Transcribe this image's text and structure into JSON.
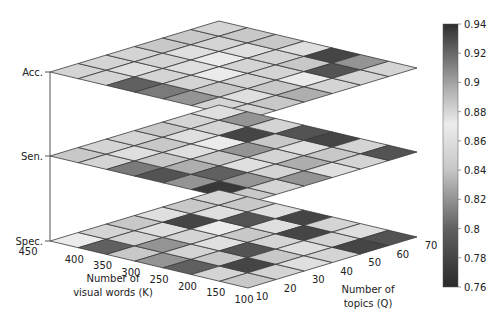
{
  "chart_data": {
    "type": "heatmap",
    "title": "",
    "layers": [
      "Acc.",
      "Sen.",
      "Spec."
    ],
    "xlabel": "Number of visual words (K)",
    "xlabel_lines": [
      "Number of",
      "visual words (K)"
    ],
    "ylabel": "Number of topics (Q)",
    "ylabel_lines": [
      "Number of",
      "topics (Q)"
    ],
    "x_ticks": [
      "450",
      "400",
      "350",
      "300",
      "250",
      "200",
      "150",
      "100"
    ],
    "y_ticks": [
      "10",
      "20",
      "30",
      "40",
      "50",
      "60",
      "70"
    ],
    "colorbar": {
      "ticks": [
        "0.94",
        "0.92",
        "0.9",
        "0.88",
        "0.86",
        "0.84",
        "0.82",
        "0.8",
        "0.78",
        "0.76"
      ],
      "range": [
        0.76,
        0.94
      ]
    },
    "grid_rows_K": 7,
    "grid_cols_Q": 6,
    "series": [
      {
        "name": "Acc.",
        "values": [
          [
            0.85,
            0.85,
            0.85,
            0.84,
            0.84,
            0.85
          ],
          [
            0.85,
            0.86,
            0.85,
            0.86,
            0.85,
            0.84
          ],
          [
            0.8,
            0.85,
            0.86,
            0.87,
            0.86,
            0.84
          ],
          [
            0.81,
            0.85,
            0.87,
            0.85,
            0.85,
            0.86
          ],
          [
            0.82,
            0.84,
            0.85,
            0.85,
            0.84,
            0.78
          ],
          [
            0.85,
            0.86,
            0.84,
            0.87,
            0.79,
            0.82
          ],
          [
            0.85,
            0.84,
            0.83,
            0.85,
            0.85,
            0.85
          ]
        ]
      },
      {
        "name": "Sen.",
        "values": [
          [
            0.84,
            0.85,
            0.85,
            0.84,
            0.85,
            0.86
          ],
          [
            0.85,
            0.86,
            0.84,
            0.86,
            0.85,
            0.82
          ],
          [
            0.81,
            0.84,
            0.86,
            0.87,
            0.78,
            0.85
          ],
          [
            0.79,
            0.83,
            0.84,
            0.82,
            0.84,
            0.79
          ],
          [
            0.82,
            0.8,
            0.86,
            0.85,
            0.86,
            0.78
          ],
          [
            0.77,
            0.82,
            0.85,
            0.83,
            0.84,
            0.85
          ],
          [
            0.84,
            0.85,
            0.82,
            0.86,
            0.85,
            0.79
          ]
        ]
      },
      {
        "name": "Spec.",
        "values": [
          [
            0.87,
            0.85,
            0.84,
            0.86,
            0.84,
            0.85
          ],
          [
            0.8,
            0.85,
            0.86,
            0.78,
            0.86,
            0.84
          ],
          [
            0.84,
            0.82,
            0.85,
            0.87,
            0.79,
            0.86
          ],
          [
            0.82,
            0.85,
            0.86,
            0.84,
            0.86,
            0.78
          ],
          [
            0.8,
            0.84,
            0.79,
            0.85,
            0.78,
            0.85
          ],
          [
            0.85,
            0.78,
            0.84,
            0.86,
            0.85,
            0.86
          ],
          [
            0.84,
            0.85,
            0.86,
            0.85,
            0.78,
            0.79
          ]
        ]
      }
    ]
  },
  "geometry": {
    "left_x": 50,
    "bottom_x": 248,
    "right_x": 417,
    "top_x": 219,
    "layer_left_y": [
      72,
      156,
      241
    ],
    "dy_bottom": 47,
    "dy_right": -4
  }
}
